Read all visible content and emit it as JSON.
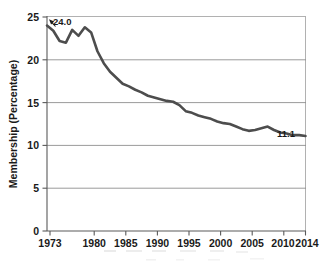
{
  "chart_data": {
    "type": "line",
    "title": "",
    "subtitle": "",
    "xlabel": "",
    "ylabel": "Membership (Percentage)",
    "xlim": [
      1973,
      2014
    ],
    "ylim": [
      0,
      25
    ],
    "grid": "horizontal",
    "legend": "none",
    "line_color": "#4d4d4d",
    "x_tick_labels": [
      "1973",
      "1980",
      "1985",
      "1990",
      "1995",
      "2000",
      "2005",
      "2010",
      "2014"
    ],
    "x_ticks": [
      1973,
      1980,
      1985,
      1990,
      1995,
      2000,
      2005,
      2010,
      2014
    ],
    "y_tick_labels": [
      "0",
      "5",
      "10",
      "15",
      "20",
      "25"
    ],
    "y_ticks": [
      0,
      5,
      10,
      15,
      20,
      25
    ],
    "series": [
      {
        "name": "Union membership",
        "x": [
          1973,
          1974,
          1975,
          1976,
          1977,
          1978,
          1979,
          1980,
          1981,
          1982,
          1983,
          1984,
          1985,
          1986,
          1987,
          1988,
          1989,
          1990,
          1991,
          1992,
          1993,
          1994,
          1995,
          1996,
          1997,
          1998,
          1999,
          2000,
          2001,
          2002,
          2003,
          2004,
          2005,
          2006,
          2007,
          2008,
          2009,
          2010,
          2011,
          2012,
          2013,
          2014
        ],
        "values": [
          24.0,
          23.4,
          22.2,
          22.0,
          23.5,
          22.8,
          23.8,
          23.2,
          21.0,
          19.6,
          18.6,
          17.9,
          17.2,
          16.9,
          16.5,
          16.2,
          15.8,
          15.6,
          15.4,
          15.2,
          15.1,
          14.7,
          14.0,
          13.8,
          13.5,
          13.3,
          13.1,
          12.8,
          12.6,
          12.5,
          12.2,
          11.9,
          11.7,
          11.8,
          12.0,
          12.2,
          11.8,
          11.5,
          11.4,
          11.2,
          11.2,
          11.1
        ]
      }
    ],
    "annotations": [
      {
        "text": "24.0",
        "x": 1973,
        "y": 24.0,
        "role": "start-value-callout"
      },
      {
        "text": "11.1",
        "x": 2014,
        "y": 11.1,
        "role": "end-value-label"
      }
    ]
  }
}
